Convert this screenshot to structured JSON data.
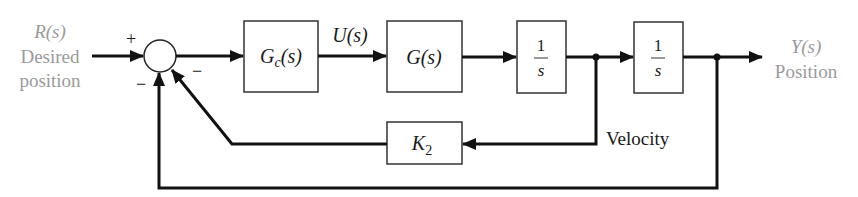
{
  "diagram": {
    "input": {
      "signal": "R(s)",
      "line1": "Desired",
      "line2": "position"
    },
    "summing_junction": {
      "plus_sign": "+",
      "minus_inner": "−",
      "minus_outer": "−"
    },
    "blocks": {
      "controller": {
        "name": "G",
        "sub": "c",
        "arg": "(s)"
      },
      "plant": {
        "label": "G(s)"
      },
      "integrator1": {
        "num": "1",
        "den": "s"
      },
      "integrator2": {
        "num": "1",
        "den": "s"
      },
      "feedback_gain": {
        "name": "K",
        "sub": "2"
      }
    },
    "signals": {
      "control": "U(s)",
      "velocity": "Velocity"
    },
    "output": {
      "signal": "Y(s)",
      "line1": "Position"
    },
    "colors": {
      "line": "#111111",
      "io_text": "#9a9a9a"
    }
  }
}
